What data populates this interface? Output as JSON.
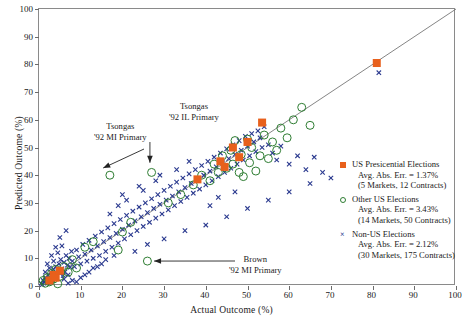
{
  "chart_data": {
    "type": "scatter",
    "title": "",
    "xlabel": "Actual Outcome (%)",
    "ylabel": "Predicted Outcome (%)",
    "xlim": [
      0,
      100
    ],
    "ylim": [
      0,
      100
    ],
    "xticks": [
      0,
      10,
      20,
      30,
      40,
      50,
      60,
      70,
      80,
      90,
      100
    ],
    "yticks": [
      0,
      10,
      20,
      30,
      40,
      50,
      60,
      70,
      80,
      90,
      100
    ],
    "grid": false,
    "legend_position": "right-center",
    "reference_line": {
      "label": "45-degree line",
      "from": [
        0,
        0
      ],
      "to": [
        100,
        100
      ],
      "color": "#777777"
    },
    "series": [
      {
        "name": "US Presicential Elections",
        "marker": "filled-square",
        "color": "#E8601C",
        "points": [
          [
            2.5,
            2.0
          ],
          [
            3.5,
            4.0
          ],
          [
            4.0,
            3.0
          ],
          [
            5.0,
            5.5
          ],
          [
            38.0,
            38.5
          ],
          [
            43.5,
            45.0
          ],
          [
            44.5,
            43.0
          ],
          [
            46.5,
            50.0
          ],
          [
            48.0,
            46.5
          ],
          [
            50.0,
            52.0
          ],
          [
            53.5,
            59.0
          ],
          [
            81.0,
            80.5
          ]
        ]
      },
      {
        "name": "Other US Elections",
        "marker": "open-circle",
        "color": "#2E7D32",
        "points": [
          [
            1.0,
            2.0
          ],
          [
            1.5,
            1.0
          ],
          [
            2.0,
            3.0
          ],
          [
            2.5,
            1.5
          ],
          [
            3.0,
            4.5
          ],
          [
            3.5,
            2.5
          ],
          [
            4.0,
            6.0
          ],
          [
            5.0,
            3.5
          ],
          [
            6.0,
            7.0
          ],
          [
            7.0,
            5.0
          ],
          [
            8.0,
            9.5
          ],
          [
            9.0,
            6.5
          ],
          [
            11.0,
            14.0
          ],
          [
            13.0,
            16.0
          ],
          [
            17.0,
            40.0
          ],
          [
            19.0,
            13.0
          ],
          [
            20.0,
            19.5
          ],
          [
            22.0,
            23.0
          ],
          [
            26.0,
            9.0
          ],
          [
            27.0,
            41.0
          ],
          [
            31.0,
            30.0
          ],
          [
            34.0,
            33.0
          ],
          [
            37.0,
            36.5
          ],
          [
            39.0,
            40.0
          ],
          [
            41.0,
            38.0
          ],
          [
            42.0,
            44.0
          ],
          [
            43.0,
            41.0
          ],
          [
            44.0,
            47.0
          ],
          [
            45.0,
            42.5
          ],
          [
            46.0,
            49.0
          ],
          [
            46.5,
            44.0
          ],
          [
            47.0,
            52.5
          ],
          [
            48.0,
            41.0
          ],
          [
            48.5,
            47.5
          ],
          [
            49.0,
            39.5
          ],
          [
            50.0,
            53.0
          ],
          [
            50.5,
            44.5
          ],
          [
            51.0,
            50.0
          ],
          [
            52.0,
            41.5
          ],
          [
            53.0,
            47.0
          ],
          [
            54.0,
            54.5
          ],
          [
            55.0,
            46.0
          ],
          [
            56.0,
            52.0
          ],
          [
            57.0,
            49.0
          ],
          [
            58.0,
            57.0
          ],
          [
            59.5,
            53.5
          ],
          [
            61.0,
            60.0
          ],
          [
            63.0,
            64.5
          ],
          [
            65.0,
            58.0
          ],
          [
            4.5,
            0.8
          ]
        ]
      },
      {
        "name": "Non-US Elections",
        "marker": "x-cross",
        "color": "#2B3A8F",
        "points": [
          [
            0.5,
            1.0
          ],
          [
            0.8,
            0.5
          ],
          [
            1.0,
            2.0
          ],
          [
            1.2,
            1.5
          ],
          [
            1.5,
            3.0
          ],
          [
            1.8,
            2.2
          ],
          [
            2.0,
            1.0
          ],
          [
            2.2,
            4.0
          ],
          [
            2.5,
            2.8
          ],
          [
            2.8,
            5.0
          ],
          [
            3.0,
            3.5
          ],
          [
            3.2,
            2.0
          ],
          [
            3.5,
            6.0
          ],
          [
            3.8,
            4.2
          ],
          [
            4.0,
            7.0
          ],
          [
            4.2,
            3.0
          ],
          [
            4.5,
            5.5
          ],
          [
            4.8,
            8.0
          ],
          [
            5.0,
            4.5
          ],
          [
            5.2,
            9.5
          ],
          [
            5.5,
            6.2
          ],
          [
            5.8,
            3.8
          ],
          [
            6.0,
            8.5
          ],
          [
            6.2,
            5.0
          ],
          [
            6.5,
            11.0
          ],
          [
            6.8,
            7.5
          ],
          [
            7.0,
            4.0
          ],
          [
            7.2,
            10.0
          ],
          [
            7.5,
            6.8
          ],
          [
            7.8,
            12.5
          ],
          [
            8.0,
            9.0
          ],
          [
            8.5,
            7.0
          ],
          [
            9.0,
            13.0
          ],
          [
            9.5,
            10.5
          ],
          [
            10.0,
            8.0
          ],
          [
            10.5,
            15.0
          ],
          [
            11.0,
            11.5
          ],
          [
            11.5,
            9.0
          ],
          [
            12.0,
            16.5
          ],
          [
            12.5,
            13.0
          ],
          [
            13.0,
            10.0
          ],
          [
            13.5,
            18.0
          ],
          [
            14.0,
            14.5
          ],
          [
            14.5,
            11.0
          ],
          [
            15.0,
            19.5
          ],
          [
            15.5,
            16.0
          ],
          [
            16.0,
            12.5
          ],
          [
            16.5,
            21.0
          ],
          [
            17.0,
            17.5
          ],
          [
            17.5,
            14.0
          ],
          [
            18.0,
            22.5
          ],
          [
            18.5,
            19.0
          ],
          [
            19.0,
            15.5
          ],
          [
            19.5,
            24.0
          ],
          [
            20.0,
            20.5
          ],
          [
            20.5,
            17.0
          ],
          [
            21.0,
            25.5
          ],
          [
            21.5,
            22.0
          ],
          [
            22.0,
            18.5
          ],
          [
            22.5,
            27.0
          ],
          [
            23.0,
            23.5
          ],
          [
            23.5,
            20.0
          ],
          [
            24.0,
            28.5
          ],
          [
            24.5,
            25.0
          ],
          [
            25.0,
            21.5
          ],
          [
            25.5,
            30.0
          ],
          [
            26.0,
            26.5
          ],
          [
            26.5,
            23.0
          ],
          [
            27.0,
            31.5
          ],
          [
            27.5,
            28.0
          ],
          [
            28.0,
            24.5
          ],
          [
            28.5,
            33.0
          ],
          [
            29.0,
            29.5
          ],
          [
            29.5,
            26.0
          ],
          [
            30.0,
            34.5
          ],
          [
            30.5,
            31.0
          ],
          [
            31.0,
            27.5
          ],
          [
            31.5,
            36.0
          ],
          [
            32.0,
            32.5
          ],
          [
            32.5,
            29.0
          ],
          [
            33.0,
            37.5
          ],
          [
            33.5,
            34.0
          ],
          [
            34.0,
            30.5
          ],
          [
            34.5,
            39.0
          ],
          [
            35.0,
            35.5
          ],
          [
            35.5,
            32.0
          ],
          [
            36.0,
            40.5
          ],
          [
            36.5,
            37.0
          ],
          [
            37.0,
            33.5
          ],
          [
            37.5,
            42.0
          ],
          [
            38.0,
            38.5
          ],
          [
            38.5,
            35.0
          ],
          [
            39.0,
            43.5
          ],
          [
            39.5,
            40.0
          ],
          [
            40.0,
            36.5
          ],
          [
            40.5,
            45.0
          ],
          [
            41.0,
            41.5
          ],
          [
            41.5,
            38.0
          ],
          [
            42.0,
            46.5
          ],
          [
            42.5,
            43.0
          ],
          [
            43.0,
            39.5
          ],
          [
            43.5,
            48.0
          ],
          [
            44.0,
            44.5
          ],
          [
            44.5,
            41.0
          ],
          [
            45.0,
            49.5
          ],
          [
            45.5,
            46.0
          ],
          [
            46.0,
            42.5
          ],
          [
            46.5,
            51.0
          ],
          [
            47.0,
            47.5
          ],
          [
            47.5,
            44.0
          ],
          [
            48.0,
            52.5
          ],
          [
            48.5,
            49.0
          ],
          [
            49.0,
            45.5
          ],
          [
            49.5,
            54.0
          ],
          [
            50.0,
            50.5
          ],
          [
            50.5,
            47.0
          ],
          [
            51.0,
            55.0
          ],
          [
            51.5,
            52.0
          ],
          [
            52.0,
            48.5
          ],
          [
            52.5,
            56.0
          ],
          [
            53.0,
            53.5
          ],
          [
            53.5,
            50.0
          ],
          [
            54.0,
            57.5
          ],
          [
            55.0,
            51.0
          ],
          [
            56.0,
            48.0
          ],
          [
            57.0,
            45.5
          ],
          [
            58.0,
            50.5
          ],
          [
            60.0,
            44.0
          ],
          [
            62.0,
            47.0
          ],
          [
            64.0,
            42.0
          ],
          [
            66.0,
            46.5
          ],
          [
            68.0,
            41.0
          ],
          [
            81.5,
            77.0
          ],
          [
            2.0,
            8.0
          ],
          [
            3.0,
            11.0
          ],
          [
            4.0,
            14.0
          ],
          [
            5.0,
            17.5
          ],
          [
            6.5,
            20.0
          ],
          [
            8.0,
            2.0
          ],
          [
            10.0,
            3.0
          ],
          [
            12.0,
            5.0
          ],
          [
            9.0,
            1.5
          ],
          [
            7.0,
            1.0
          ],
          [
            13.0,
            6.5
          ],
          [
            15.0,
            8.0
          ],
          [
            4.5,
            12.0
          ],
          [
            5.5,
            14.5
          ],
          [
            2.5,
            6.5
          ],
          [
            1.5,
            5.0
          ],
          [
            3.5,
            9.0
          ],
          [
            6.0,
            2.5
          ],
          [
            11.0,
            4.0
          ],
          [
            14.0,
            7.0
          ],
          [
            16.0,
            9.5
          ],
          [
            18.0,
            11.0
          ],
          [
            23.0,
            12.5
          ],
          [
            26.0,
            15.0
          ],
          [
            30.0,
            17.0
          ],
          [
            35.0,
            20.0
          ],
          [
            40.0,
            22.0
          ],
          [
            45.0,
            25.0
          ],
          [
            50.0,
            28.0
          ],
          [
            55.0,
            31.0
          ],
          [
            60.0,
            34.0
          ],
          [
            65.0,
            37.0
          ],
          [
            70.0,
            39.0
          ],
          [
            20.0,
            33.0
          ],
          [
            24.0,
            36.0
          ],
          [
            28.0,
            38.0
          ],
          [
            19.0,
            29.0
          ],
          [
            17.0,
            26.0
          ],
          [
            21.0,
            31.0
          ],
          [
            25.0,
            34.5
          ],
          [
            29.0,
            40.0
          ],
          [
            33.0,
            42.0
          ],
          [
            36.0,
            45.0
          ],
          [
            41.0,
            29.0
          ],
          [
            43.0,
            32.0
          ],
          [
            47.0,
            34.0
          ]
        ]
      }
    ],
    "annotations": [
      {
        "name": "tsongas-mi-annotation",
        "line1": "Tsongas",
        "line2": "'92 MI Primary",
        "points_to": [
          17,
          40
        ],
        "arrow": "down-right"
      },
      {
        "name": "tsongas-il-annotation",
        "line1": "Tsongas",
        "line2": "'92 IL Primary",
        "points_to": [
          27,
          41
        ],
        "arrow": "down"
      },
      {
        "name": "brown-mi-annotation",
        "line1": "Brown",
        "line2": "'92 MI Primary",
        "points_to": [
          26,
          9
        ],
        "arrow": "left"
      }
    ],
    "legend": [
      {
        "label": "US Presicential Elections",
        "error_line": "Avg. Abs. Err. = 1.37%",
        "count_line": "(5 Markets, 12 Contracts)",
        "marker": "filled-square",
        "color": "#E8601C",
        "avg_abs_err": 1.37,
        "markets": 5,
        "contracts": 12
      },
      {
        "label": "Other US Elections",
        "error_line": "Avg. Abs. Err. = 3.43%",
        "count_line": "(14 Markets, 50 Contracts)",
        "marker": "open-circle",
        "color": "#2E7D32",
        "avg_abs_err": 3.43,
        "markets": 14,
        "contracts": 50
      },
      {
        "label": "Non-US Elections",
        "error_line": "Avg. Abs. Err. = 2.12%",
        "count_line": "(30 Markets, 175 Contracts)",
        "marker": "x-cross",
        "color": "#2B3A8F",
        "avg_abs_err": 2.12,
        "markets": 30,
        "contracts": 175
      }
    ]
  }
}
